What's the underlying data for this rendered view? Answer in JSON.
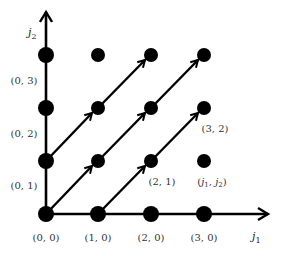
{
  "diagram": {
    "type": "lattice-diagram",
    "axes": {
      "x_label": "j",
      "x_sub": "1",
      "y_label": "j",
      "y_sub": "2"
    },
    "colors": {
      "ink": "#000000",
      "label": "#333333",
      "background": "#ffffff"
    },
    "grid_points": [
      [
        0,
        0
      ],
      [
        1,
        0
      ],
      [
        2,
        0
      ],
      [
        3,
        0
      ],
      [
        0,
        1
      ],
      [
        1,
        1
      ],
      [
        2,
        1
      ],
      [
        3,
        1
      ],
      [
        0,
        2
      ],
      [
        1,
        2
      ],
      [
        2,
        2
      ],
      [
        3,
        2
      ],
      [
        0,
        3
      ],
      [
        1,
        3
      ],
      [
        2,
        3
      ],
      [
        3,
        3
      ]
    ],
    "arrow_chains": [
      [
        [
          0,
          0
        ],
        [
          1,
          1
        ],
        [
          2,
          2
        ],
        [
          3,
          3
        ]
      ],
      [
        [
          0,
          1
        ],
        [
          1,
          2
        ],
        [
          2,
          3
        ]
      ],
      [
        [
          1,
          0
        ],
        [
          2,
          1
        ],
        [
          3,
          2
        ]
      ]
    ],
    "labels": {
      "p00": "(0, 0)",
      "p10": "(1, 0)",
      "p20": "(2, 0)",
      "p30": "(3, 0)",
      "p01": "(0, 1)",
      "p02": "(0, 2)",
      "p03": "(0, 3)",
      "p21": "(2, 1)",
      "p32": "(3, 2)",
      "generic_open": "(",
      "generic_j1": "j",
      "generic_sub1": "1",
      "generic_comma": ", ",
      "generic_j2": "j",
      "generic_sub2": "2",
      "generic_close": ")"
    }
  }
}
